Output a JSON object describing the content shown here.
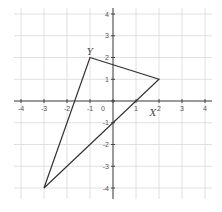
{
  "diagram": {
    "type": "coordinate-plane",
    "x_range": [
      -4,
      4
    ],
    "y_range": [
      -4,
      4
    ],
    "grid": true,
    "x_ticks": [
      "-4",
      "-3",
      "-2",
      "-1",
      "0",
      "1",
      "2",
      "3",
      "4"
    ],
    "y_ticks": [
      "4",
      "3",
      "2",
      "1",
      "-1",
      "-2",
      "-3",
      "-4"
    ],
    "origin_label": "0",
    "triangle": {
      "vertices": [
        {
          "label": "Y",
          "x": -1,
          "y": 2
        },
        {
          "label": "X",
          "x": 2,
          "y": 1
        },
        {
          "label": "",
          "x": -3,
          "y": -4
        }
      ]
    },
    "colors": {
      "grid": "#d8d8d8",
      "axis": "#444444",
      "shape": "#333333"
    }
  }
}
